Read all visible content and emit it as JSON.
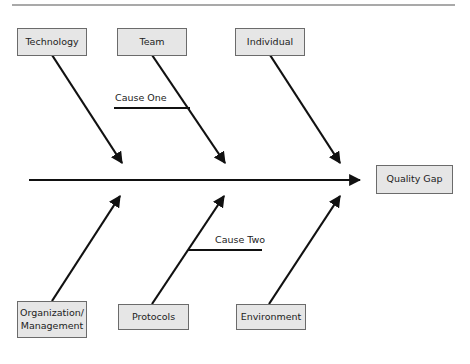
{
  "diagram": {
    "type": "fishbone",
    "effect": "Quality Gap",
    "top_categories": [
      "Technology",
      "Team",
      "Individual"
    ],
    "bottom_categories": [
      "Organization/\nManagement",
      "Protocols",
      "Environment"
    ],
    "sub_causes": [
      {
        "label": "Cause One",
        "attached_to": "Team"
      },
      {
        "label": "Cause Two",
        "attached_to": "Protocols"
      }
    ]
  },
  "colors": {
    "line": "#111111",
    "box_fill": "#e6e6e6",
    "box_border": "#6b6b6b",
    "rule": "#555555",
    "text": "#222222"
  }
}
